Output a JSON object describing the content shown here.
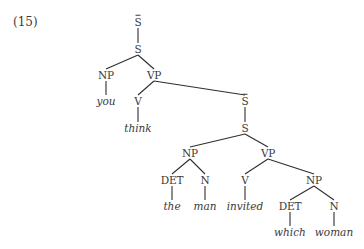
{
  "example_number": "(15)",
  "tree": {
    "nodes": [
      {
        "id": "sbar1",
        "label": "S",
        "overbar": true,
        "type": "cat",
        "x": 138,
        "y": 22
      },
      {
        "id": "s1",
        "label": "S",
        "overbar": false,
        "type": "cat",
        "x": 138,
        "y": 49
      },
      {
        "id": "np1",
        "label": "NP",
        "overbar": false,
        "type": "cat",
        "x": 106,
        "y": 75
      },
      {
        "id": "vp1",
        "label": "VP",
        "overbar": false,
        "type": "cat",
        "x": 154,
        "y": 75
      },
      {
        "id": "you",
        "label": "you",
        "overbar": false,
        "type": "word",
        "x": 106,
        "y": 101
      },
      {
        "id": "v1",
        "label": "V",
        "overbar": false,
        "type": "cat",
        "x": 138,
        "y": 101
      },
      {
        "id": "think",
        "label": "think",
        "overbar": false,
        "type": "word",
        "x": 138,
        "y": 128
      },
      {
        "id": "sbar2",
        "label": "S",
        "overbar": true,
        "type": "cat",
        "x": 245,
        "y": 101
      },
      {
        "id": "s2",
        "label": "S",
        "overbar": false,
        "type": "cat",
        "x": 245,
        "y": 128
      },
      {
        "id": "np2",
        "label": "NP",
        "overbar": false,
        "type": "cat",
        "x": 190,
        "y": 153
      },
      {
        "id": "vp2",
        "label": "VP",
        "overbar": false,
        "type": "cat",
        "x": 268,
        "y": 153
      },
      {
        "id": "det1",
        "label": "DET",
        "overbar": false,
        "type": "cat",
        "x": 172,
        "y": 180
      },
      {
        "id": "n1",
        "label": "N",
        "overbar": false,
        "type": "cat",
        "x": 205,
        "y": 180
      },
      {
        "id": "v2",
        "label": "V",
        "overbar": false,
        "type": "cat",
        "x": 245,
        "y": 180
      },
      {
        "id": "np3",
        "label": "NP",
        "overbar": false,
        "type": "cat",
        "x": 314,
        "y": 180
      },
      {
        "id": "the",
        "label": "the",
        "overbar": false,
        "type": "word",
        "x": 172,
        "y": 206
      },
      {
        "id": "man",
        "label": "man",
        "overbar": false,
        "type": "word",
        "x": 205,
        "y": 206
      },
      {
        "id": "invited",
        "label": "invited",
        "overbar": false,
        "type": "word",
        "x": 245,
        "y": 206
      },
      {
        "id": "det2",
        "label": "DET",
        "overbar": false,
        "type": "cat",
        "x": 290,
        "y": 206
      },
      {
        "id": "n2",
        "label": "N",
        "overbar": false,
        "type": "cat",
        "x": 334,
        "y": 206
      },
      {
        "id": "which",
        "label": "which",
        "overbar": false,
        "type": "word",
        "x": 290,
        "y": 232
      },
      {
        "id": "woman",
        "label": "woman",
        "overbar": false,
        "type": "word",
        "x": 334,
        "y": 232
      }
    ],
    "edges": [
      [
        "sbar1",
        "s1"
      ],
      [
        "s1",
        "np1"
      ],
      [
        "s1",
        "vp1"
      ],
      [
        "np1",
        "you"
      ],
      [
        "vp1",
        "v1"
      ],
      [
        "vp1",
        "sbar2"
      ],
      [
        "v1",
        "think"
      ],
      [
        "sbar2",
        "s2"
      ],
      [
        "s2",
        "np2"
      ],
      [
        "s2",
        "vp2"
      ],
      [
        "np2",
        "det1"
      ],
      [
        "np2",
        "n1"
      ],
      [
        "det1",
        "the"
      ],
      [
        "n1",
        "man"
      ],
      [
        "vp2",
        "v2"
      ],
      [
        "vp2",
        "np3"
      ],
      [
        "v2",
        "invited"
      ],
      [
        "np3",
        "det2"
      ],
      [
        "np3",
        "n2"
      ],
      [
        "det2",
        "which"
      ],
      [
        "n2",
        "woman"
      ]
    ]
  }
}
